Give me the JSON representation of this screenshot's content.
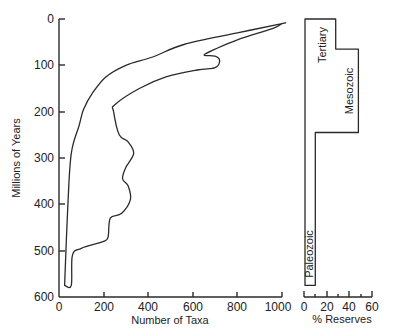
{
  "chart_data": [
    {
      "type": "area",
      "title": "",
      "xlabel": "Number of Taxa",
      "ylabel": "Millions of Years",
      "xlim": [
        0,
        1000
      ],
      "ylim": [
        600,
        0
      ],
      "y_inverted": true,
      "grid": false,
      "x_ticks": [
        0,
        200,
        400,
        600,
        800,
        1000
      ],
      "y_ticks": [
        0,
        100,
        200,
        300,
        400,
        500,
        600
      ],
      "description": "Closed envelope (spindle) of taxonomic diversity through time; left edge = lower bound, right edge = upper bound",
      "series": [
        {
          "name": "lower bound (left edge)",
          "points": [
            [
              25,
              575
            ],
            [
              40,
              400
            ],
            [
              55,
              290
            ],
            [
              90,
              230
            ],
            [
              110,
              195
            ],
            [
              150,
              160
            ],
            [
              210,
              125
            ],
            [
              300,
              100
            ],
            [
              420,
              82
            ],
            [
              560,
              55
            ],
            [
              800,
              30
            ],
            [
              1000,
              10
            ]
          ]
        },
        {
          "name": "upper bound (right edge)",
          "points": [
            [
              1000,
              10
            ],
            [
              960,
              20
            ],
            [
              800,
              45
            ],
            [
              700,
              65
            ],
            [
              650,
              78
            ],
            [
              700,
              80
            ],
            [
              720,
              90
            ],
            [
              700,
              105
            ],
            [
              620,
              110
            ],
            [
              480,
              125
            ],
            [
              360,
              150
            ],
            [
              250,
              185
            ],
            [
              245,
              200
            ],
            [
              270,
              250
            ],
            [
              310,
              265
            ],
            [
              335,
              290
            ],
            [
              300,
              320
            ],
            [
              285,
              345
            ],
            [
              310,
              360
            ],
            [
              320,
              390
            ],
            [
              280,
              420
            ],
            [
              230,
              430
            ],
            [
              220,
              470
            ],
            [
              200,
              480
            ],
            [
              100,
              495
            ],
            [
              60,
              510
            ],
            [
              55,
              575
            ],
            [
              25,
              575
            ]
          ]
        }
      ]
    },
    {
      "type": "bar",
      "title": "",
      "xlabel": "% Reserves",
      "ylabel": "",
      "xlim": [
        0,
        60
      ],
      "ylim": [
        600,
        0
      ],
      "x_ticks": [
        0,
        20,
        40,
        60
      ],
      "x_minor_ticks": [
        10,
        30,
        50
      ],
      "orientation": "horizontal-step",
      "categories": [
        "Tertiary",
        "Mesozoic",
        "Paleozoic"
      ],
      "series": [
        {
          "name": "% Reserves",
          "values": [
            28,
            48,
            10
          ],
          "age_ranges_my": [
            [
              0,
              65
            ],
            [
              65,
              245
            ],
            [
              245,
              575
            ]
          ]
        }
      ]
    }
  ],
  "main_chart": {
    "xlabel": "Number of Taxa",
    "ylabel": "Millions of Years",
    "x_tick_labels": [
      "0",
      "200",
      "400",
      "600",
      "800",
      "1000"
    ],
    "y_tick_labels": [
      "0",
      "100",
      "200",
      "300",
      "400",
      "500",
      "600"
    ]
  },
  "side_chart": {
    "xlabel": "% Reserves",
    "x_tick_labels": [
      "0",
      "20",
      "40",
      "60"
    ],
    "periods": {
      "tertiary": "Tertiary",
      "mesozoic": "Mesozoic",
      "paleozoic": "Paleozoic"
    }
  }
}
